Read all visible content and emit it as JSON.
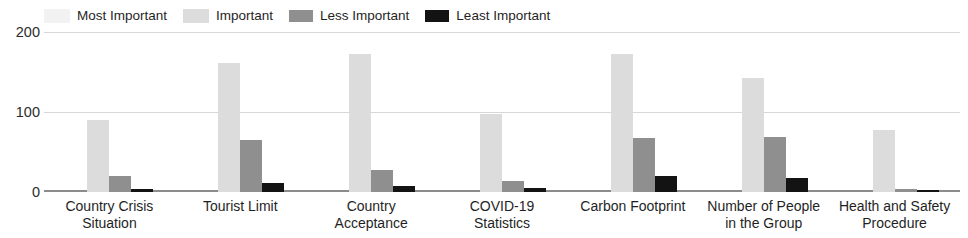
{
  "chart_data": {
    "type": "bar",
    "title": "",
    "subtitle": "",
    "xlabel": "",
    "ylabel": "",
    "ylim": [
      0,
      200
    ],
    "yticks": [
      0,
      100,
      200
    ],
    "ytick_labels": [
      "0",
      "100",
      "200"
    ],
    "grid": true,
    "legend_position": "top-left",
    "orientation": "vertical",
    "grouping": "grouped",
    "categories": [
      "Country Crisis Situation",
      "Tourist Limit",
      "Country Acceptance",
      "COVID-19 Statistics",
      "Carbon Footprint",
      "Number of People in the Group",
      "Health and Safety Procedure"
    ],
    "category_lines": [
      [
        "Country Crisis",
        "Situation"
      ],
      [
        "Tourist Limit",
        ""
      ],
      [
        "Country",
        "Acceptance"
      ],
      [
        "COVID-19",
        "Statistics"
      ],
      [
        "Carbon Footprint",
        ""
      ],
      [
        "Number of People",
        "in the Group"
      ],
      [
        "Health and Safety",
        "Procedure"
      ]
    ],
    "series": [
      {
        "name": "Most Important",
        "color": "#f2f2f2",
        "values": [
          0,
          0,
          0,
          0,
          0,
          0,
          0
        ]
      },
      {
        "name": "Important",
        "color": "#dcdcdc",
        "values": [
          90,
          161,
          172,
          97,
          172,
          143,
          77
        ]
      },
      {
        "name": "Less Important",
        "color": "#8f8f8f",
        "values": [
          20,
          65,
          28,
          14,
          67,
          69,
          4
        ]
      },
      {
        "name": "Least Important",
        "color": "#131313",
        "values": [
          4,
          11,
          7,
          5,
          20,
          18,
          2
        ]
      }
    ]
  },
  "legend": {
    "items": [
      {
        "label": "Most Important",
        "color": "#f2f2f2"
      },
      {
        "label": "Important",
        "color": "#dcdcdc"
      },
      {
        "label": "Less Important",
        "color": "#8f8f8f"
      },
      {
        "label": "Least Important",
        "color": "#131313"
      }
    ]
  },
  "axis": {
    "y_ticks": [
      "200",
      "100",
      "0"
    ]
  },
  "colors": {
    "gridline": "#d7d7d7",
    "baseline": "#8c8c8c",
    "text": "#1f1f1f",
    "background": "#ffffff"
  }
}
